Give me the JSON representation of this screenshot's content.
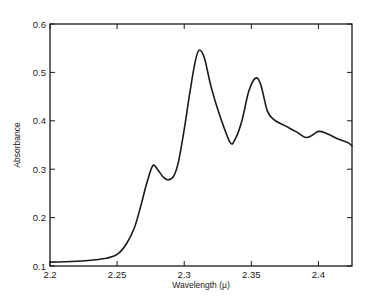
{
  "chart_data": {
    "type": "line",
    "title": "",
    "xlabel": "Wavelength (μ)",
    "ylabel": "Absorbance",
    "xlim": [
      2.2,
      2.425
    ],
    "ylim": [
      0.1,
      0.6
    ],
    "x_ticks": [
      2.2,
      2.25,
      2.3,
      2.35,
      2.4
    ],
    "x_tick_labels": [
      "2.2",
      "2.25",
      "2.3",
      "2.35",
      "2.4"
    ],
    "y_ticks": [
      0.1,
      0.2,
      0.3,
      0.4,
      0.5,
      0.6
    ],
    "y_tick_labels": [
      "0.1",
      "0.2",
      "0.3",
      "0.4",
      "0.5",
      "0.6"
    ],
    "grid": false,
    "legend": null,
    "line_color": "#1a1a1a",
    "series": [
      {
        "name": "Absorbance spectrum",
        "x": [
          2.2,
          2.22,
          2.234,
          2.242,
          2.25,
          2.257,
          2.263,
          2.268,
          2.272,
          2.2765,
          2.28,
          2.284,
          2.2875,
          2.292,
          2.2955,
          2.3,
          2.304,
          2.308,
          2.311,
          2.315,
          2.32,
          2.326,
          2.334,
          2.338,
          2.343,
          2.348,
          2.353,
          2.357,
          2.362,
          2.367,
          2.375,
          2.383,
          2.39,
          2.394,
          2.4,
          2.406,
          2.415,
          2.422,
          2.425
        ],
        "y": [
          0.108,
          0.11,
          0.113,
          0.116,
          0.124,
          0.146,
          0.18,
          0.228,
          0.27,
          0.307,
          0.3,
          0.285,
          0.278,
          0.285,
          0.313,
          0.382,
          0.455,
          0.52,
          0.546,
          0.53,
          0.47,
          0.415,
          0.356,
          0.362,
          0.4,
          0.46,
          0.488,
          0.475,
          0.42,
          0.402,
          0.39,
          0.378,
          0.366,
          0.368,
          0.378,
          0.374,
          0.362,
          0.355,
          0.348
        ]
      }
    ],
    "annotations": {
      "peaks": [
        {
          "x": 2.2765,
          "y": 0.307
        },
        {
          "x": 2.311,
          "y": 0.546
        },
        {
          "x": 2.353,
          "y": 0.488
        },
        {
          "x": 2.4,
          "y": 0.378
        }
      ]
    }
  }
}
